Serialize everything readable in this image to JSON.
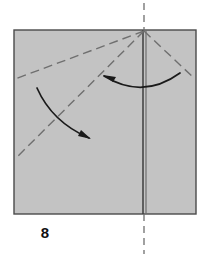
{
  "figure": {
    "kind": "origami-fold-diagram",
    "step_label": "8",
    "canvas": {
      "width": 209,
      "height": 261
    },
    "colors": {
      "background": "#ffffff",
      "paper_fill": "#c3c3c3",
      "paper_stroke": "#4a4a4a",
      "fold_line": "#6e6e6e",
      "crease_dash": "#6f6f6f",
      "center_edge": "#3d3d3d",
      "arrow": "#1a1a1a",
      "label_text": "#111111"
    },
    "paper": {
      "shape": "square",
      "x": 14,
      "y": 30,
      "width": 182,
      "height": 184
    },
    "center_line": {
      "name": "vertical-folded-edge",
      "x": 144,
      "y_top": 30,
      "y_bottom": 214,
      "style": "solid"
    },
    "axis_line": {
      "name": "vertical-axis-dashed",
      "x": 144,
      "segments": [
        {
          "y_start": 3,
          "y_end": 30
        },
        {
          "y_start": 214,
          "y_end": 254
        }
      ],
      "style": "dashed"
    },
    "apex": {
      "x": 144,
      "y": 31
    },
    "crease_lines": [
      {
        "name": "crease-upper-left",
        "x1": 144,
        "y1": 31,
        "x2": 15,
        "y2": 79,
        "style": "dashed"
      },
      {
        "name": "crease-diagonal-left",
        "x1": 144,
        "y1": 31,
        "x2": 16,
        "y2": 158,
        "style": "dashed"
      },
      {
        "name": "crease-upper-right",
        "x1": 144,
        "y1": 31,
        "x2": 195,
        "y2": 79,
        "style": "dashed"
      }
    ],
    "arrows": [
      {
        "name": "arrow-fold-right-to-left",
        "description": "curved arrow sweeping from right crease toward left, arrowhead at left",
        "path": "M 180 73 Q 143 100 104 76",
        "head_at": {
          "x": 104,
          "y": 76
        },
        "head_angle_deg": 210
      },
      {
        "name": "arrow-fold-down-right",
        "description": "curved arrow from upper-left sweeping down to lower-right, arrowhead at lower right",
        "path": "M 37 88 Q 52 122 89 138",
        "head_at": {
          "x": 89,
          "y": 138
        },
        "head_angle_deg": 24
      }
    ]
  }
}
